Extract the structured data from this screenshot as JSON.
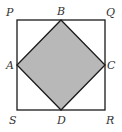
{
  "diagram": {
    "colors": {
      "stroke": "#1a1a1a",
      "shade": "#b8b8b8",
      "label": "#333333"
    },
    "points": {
      "P": {
        "label": "P",
        "x": 17,
        "y": 20
      },
      "Q": {
        "label": "Q",
        "x": 105,
        "y": 20
      },
      "R": {
        "label": "R",
        "x": 105,
        "y": 110
      },
      "S": {
        "label": "S",
        "x": 17,
        "y": 110
      },
      "A": {
        "label": "A",
        "x": 17,
        "y": 65
      },
      "B": {
        "label": "B",
        "x": 61,
        "y": 20
      },
      "C": {
        "label": "C",
        "x": 105,
        "y": 65
      },
      "D": {
        "label": "D",
        "x": 61,
        "y": 110
      }
    },
    "labels": [
      "P",
      "Q",
      "R",
      "S",
      "A",
      "B",
      "C",
      "D"
    ]
  }
}
